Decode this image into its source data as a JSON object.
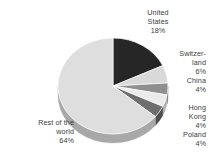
{
  "chart_data": {
    "type": "pie",
    "title": "",
    "subtitle": "",
    "xlabel": "",
    "ylabel": "",
    "grid": false,
    "legend_position": "none",
    "three_d": true,
    "start_angle_deg": 0,
    "direction": "clockwise",
    "categories": [
      "United States",
      "Switzerland",
      "China",
      "Hong Kong",
      "Poland",
      "Rest of the world"
    ],
    "values": [
      18,
      6,
      4,
      4,
      4,
      64
    ],
    "value_suffix": "%",
    "colors": [
      "#262626",
      "#d9d9d9",
      "#8f8f8f",
      "#ebebeb",
      "#6e6e6e",
      "#dedede"
    ],
    "side_colors": [
      "#1a1a1a",
      "#a8a8a8",
      "#6b6b6b",
      "#b5b5b5",
      "#4f4f4f",
      "#a8a8a8"
    ],
    "slices": [
      {
        "name": "United States",
        "value": 18,
        "label": "United\nStates\n18%",
        "color": "#262626",
        "side_color": "#1a1a1a"
      },
      {
        "name": "Switzerland",
        "value": 6,
        "label": "Switzer-\nland\n6%",
        "color": "#d9d9d9",
        "side_color": "#a8a8a8"
      },
      {
        "name": "China",
        "value": 4,
        "label": "China\n4%",
        "color": "#8f8f8f",
        "side_color": "#6b6b6b"
      },
      {
        "name": "Hong Kong",
        "value": 4,
        "label": "Hong\nKong\n4%",
        "color": "#ebebeb",
        "side_color": "#b5b5b5"
      },
      {
        "name": "Poland",
        "value": 4,
        "label": "Poland\n4%",
        "color": "#6e6e6e",
        "side_color": "#4f4f4f"
      },
      {
        "name": "Rest of the world",
        "value": 64,
        "label": "Rest of the\nworld\n64%",
        "color": "#dedede",
        "side_color": "#a8a8a8"
      }
    ]
  },
  "labels": {
    "united_states": "United\nStates\n18%",
    "switzerland": "Switzer-\nland\n6%",
    "china": "China\n4%",
    "hong_kong": "Hong\nKong\n4%",
    "poland": "Poland\n4%",
    "rest_of_world": "Rest of the\nworld\n64%"
  },
  "geometry": {
    "center_x": 113,
    "center_y": 86,
    "radius_x": 55,
    "radius_y": 48,
    "depth": 9
  },
  "background": "#ffffff",
  "text_color": "#3d3d3d"
}
